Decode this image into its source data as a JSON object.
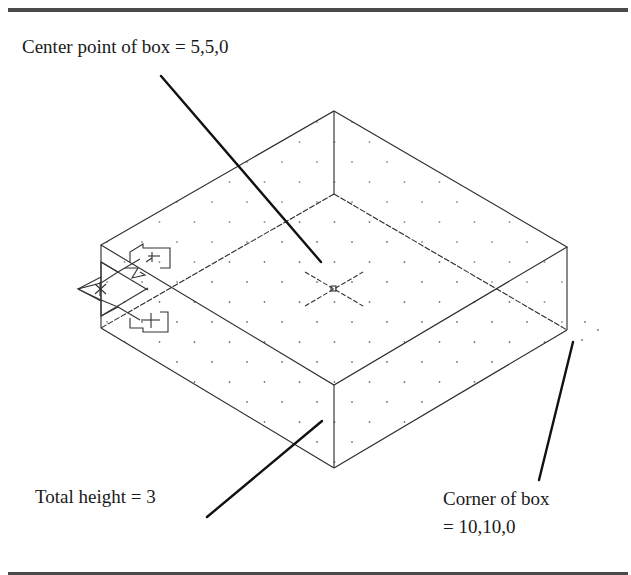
{
  "figure": {
    "labels": {
      "center_point": "Center point of box = 5,5,0",
      "total_height": "Total height = 3",
      "corner_line1": "Corner of box",
      "corner_line2": "= 10,10,0"
    },
    "box": {
      "center": [
        5,
        5,
        0
      ],
      "corner": [
        10,
        10,
        0
      ],
      "height": 3
    },
    "icons": [
      "ucs-icon",
      "cursor-crosshair-icon",
      "grid-dots"
    ],
    "colors": {
      "line": "#2a2a2a",
      "leader": "#111111",
      "grid_dot": "#777777",
      "rule": "#4a4a4a"
    }
  }
}
